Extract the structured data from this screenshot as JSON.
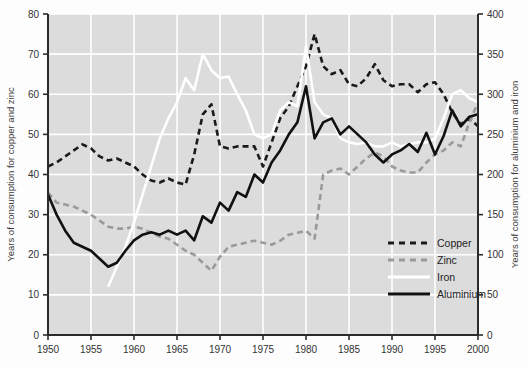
{
  "chart_data": {
    "type": "line",
    "title": "",
    "xlabel": "",
    "ylabel": "Years of consumption for copper and zinc",
    "ylabel_right": "Years of consumption for aluminium and iron",
    "xlim": [
      1950,
      2000
    ],
    "ylim": [
      0,
      80
    ],
    "ylim_right": [
      0,
      400
    ],
    "xticks": [
      1950,
      1955,
      1960,
      1965,
      1970,
      1975,
      1980,
      1985,
      1990,
      1995,
      2000
    ],
    "yticks": [
      0,
      10,
      20,
      30,
      40,
      50,
      60,
      70,
      80
    ],
    "yticks_right": [
      0,
      50,
      100,
      150,
      200,
      250,
      300,
      350,
      400
    ],
    "grid": true,
    "grid_color": "#ffffff",
    "plot_background": "#dcdcdc",
    "legend_position": "lower right",
    "legend_entries": [
      "Copper",
      "Zinc",
      "Iron",
      "Aluminium"
    ],
    "x": [
      1950,
      1951,
      1952,
      1953,
      1954,
      1955,
      1956,
      1957,
      1958,
      1959,
      1960,
      1961,
      1962,
      1963,
      1964,
      1965,
      1966,
      1967,
      1968,
      1969,
      1970,
      1971,
      1972,
      1973,
      1974,
      1975,
      1976,
      1977,
      1978,
      1979,
      1980,
      1981,
      1982,
      1983,
      1984,
      1985,
      1986,
      1987,
      1988,
      1989,
      1990,
      1991,
      1992,
      1993,
      1994,
      1995,
      1996,
      1997,
      1998,
      1999,
      2000
    ],
    "series": [
      {
        "name": "Copper",
        "axis": "left",
        "style": "dashed",
        "color": "#1a1a1a",
        "values": [
          42,
          43,
          44.5,
          46,
          47.5,
          46.5,
          44.5,
          43.5,
          44,
          43,
          42,
          40,
          38.5,
          38,
          39,
          38,
          37.5,
          45,
          55,
          57.5,
          47,
          46.5,
          47,
          47,
          47,
          42,
          48,
          54,
          57,
          62,
          67,
          75,
          67,
          65,
          66,
          62.5,
          62,
          64,
          67.5,
          63.5,
          62,
          62.5,
          62.5,
          60.5,
          62.5,
          63,
          60,
          55.5,
          52.5,
          54,
          52
        ]
      },
      {
        "name": "Zinc",
        "axis": "left",
        "style": "dashed",
        "color": "#9a9a9a",
        "values": [
          35.5,
          33,
          32.5,
          32,
          31,
          30,
          28.5,
          27,
          26.5,
          26.5,
          27,
          26.5,
          25.5,
          24.5,
          24,
          22.5,
          21,
          20,
          18,
          16,
          19.5,
          22,
          22.5,
          23,
          23.5,
          23,
          22.5,
          23.5,
          25,
          25.5,
          26,
          24,
          40,
          41,
          41.5,
          40,
          42,
          44,
          45.5,
          44.5,
          42,
          41,
          40.5,
          40.5,
          43,
          45,
          46,
          48,
          47,
          53,
          58
        ]
      },
      {
        "name": "Iron",
        "axis": "right",
        "style": "solid",
        "color": "#ffffff",
        "values": [
          null,
          null,
          null,
          null,
          null,
          null,
          null,
          60,
          85,
          110,
          140,
          175,
          210,
          245,
          270,
          290,
          320,
          305,
          350,
          330,
          320,
          322,
          300,
          280,
          250,
          245,
          250,
          280,
          290,
          285,
          360,
          290,
          275,
          270,
          245,
          240,
          238,
          240,
          235,
          235,
          240,
          235,
          238,
          240,
          240,
          245,
          270,
          300,
          305,
          295,
          290
        ]
      },
      {
        "name": "Aluminium",
        "axis": "right",
        "style": "solid",
        "color": "#111111",
        "values": [
          175,
          150,
          130,
          115,
          110,
          105,
          95,
          85,
          90,
          105,
          118,
          125,
          128,
          125,
          130,
          125,
          130,
          118,
          148,
          140,
          165,
          155,
          178,
          172,
          200,
          190,
          215,
          230,
          250,
          265,
          310,
          245,
          265,
          270,
          250,
          260,
          250,
          240,
          225,
          215,
          225,
          230,
          238,
          228,
          252,
          225,
          248,
          280,
          260,
          272,
          275
        ]
      }
    ]
  }
}
